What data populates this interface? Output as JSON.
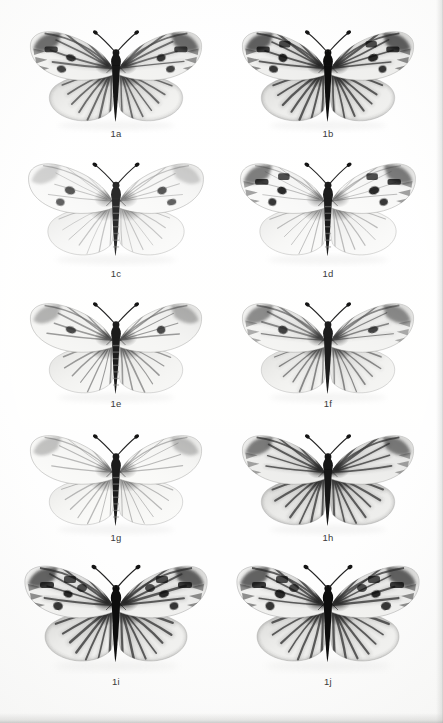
{
  "plate": {
    "title": "Butterfly specimen plate",
    "background_color": "#fbfbfa",
    "label_color": "#3a3a3a",
    "columns": 2,
    "rows": 5,
    "specimen_count": 10
  },
  "specimens": [
    {
      "label": "1a",
      "row": 1,
      "column": 1,
      "x": 22,
      "y": 24,
      "w": 188,
      "h": 104,
      "label_y": 128,
      "pattern": "veins-dark-heavy",
      "spot_count": 3,
      "ground_tone": "#f2f2f0",
      "vein_tone": "#4a4a4a",
      "spot_tone": "#1a1a1a",
      "body_tone": "#151515",
      "wing_shade": 0.62,
      "apex_dark": 0.78,
      "tilt": 0
    },
    {
      "label": "1b",
      "row": 1,
      "column": 2,
      "x": 234,
      "y": 24,
      "w": 188,
      "h": 104,
      "label_y": 128,
      "pattern": "veins-dark-heavy-banded",
      "spot_count": 4,
      "ground_tone": "#efefed",
      "vein_tone": "#3c3c3c",
      "spot_tone": "#111111",
      "body_tone": "#101010",
      "wing_shade": 0.72,
      "apex_dark": 0.86,
      "tilt": 0
    },
    {
      "label": "1c",
      "row": 2,
      "column": 1,
      "x": 20,
      "y": 156,
      "w": 192,
      "h": 110,
      "label_y": 268,
      "pattern": "pale-faint-veins",
      "spot_count": 2,
      "ground_tone": "#fafaf9",
      "vein_tone": "#9a9a9a",
      "spot_tone": "#3f3f3f",
      "body_tone": "#2b2b2b",
      "wing_shade": 0.18,
      "apex_dark": 0.22,
      "tilt": 0
    },
    {
      "label": "1d",
      "row": 2,
      "column": 2,
      "x": 232,
      "y": 156,
      "w": 192,
      "h": 110,
      "label_y": 268,
      "pattern": "pale-bold-spots",
      "spot_count": 4,
      "ground_tone": "#fafaf9",
      "vein_tone": "#8d8d8d",
      "spot_tone": "#0f0f0f",
      "body_tone": "#1b1b1b",
      "wing_shade": 0.22,
      "apex_dark": 0.7,
      "tilt": 0
    },
    {
      "label": "1e",
      "row": 3,
      "column": 1,
      "x": 22,
      "y": 296,
      "w": 188,
      "h": 102,
      "label_y": 398,
      "pattern": "veins-medium",
      "spot_count": 1,
      "ground_tone": "#f6f6f4",
      "vein_tone": "#6a6a6a",
      "spot_tone": "#333333",
      "body_tone": "#1e1e1e",
      "wing_shade": 0.4,
      "apex_dark": 0.38,
      "tilt": 0
    },
    {
      "label": "1f",
      "row": 3,
      "column": 2,
      "x": 234,
      "y": 296,
      "w": 188,
      "h": 102,
      "label_y": 398,
      "pattern": "veins-medium-banded",
      "spot_count": 1,
      "ground_tone": "#f4f4f2",
      "vein_tone": "#5e5e5e",
      "spot_tone": "#2a2a2a",
      "body_tone": "#1a1a1a",
      "wing_shade": 0.5,
      "apex_dark": 0.6,
      "tilt": 0
    },
    {
      "label": "1g",
      "row": 4,
      "column": 1,
      "x": 22,
      "y": 428,
      "w": 188,
      "h": 104,
      "label_y": 532,
      "pattern": "pale-fine-veins",
      "spot_count": 0,
      "ground_tone": "#fafaf8",
      "vein_tone": "#8a8a8a",
      "spot_tone": "#444444",
      "body_tone": "#1d1d1d",
      "wing_shade": 0.26,
      "apex_dark": 0.3,
      "tilt": 0
    },
    {
      "label": "1h",
      "row": 4,
      "column": 2,
      "x": 234,
      "y": 428,
      "w": 188,
      "h": 104,
      "label_y": 532,
      "pattern": "veins-dark-broad",
      "spot_count": 0,
      "ground_tone": "#ededeb",
      "vein_tone": "#3f3f3f",
      "spot_tone": "#202020",
      "body_tone": "#141414",
      "wing_shade": 0.74,
      "apex_dark": 0.68,
      "tilt": 0
    },
    {
      "label": "1i",
      "row": 5,
      "column": 1,
      "x": 16,
      "y": 558,
      "w": 200,
      "h": 116,
      "label_y": 676,
      "pattern": "veins-dark-heavy-spotted",
      "spot_count": 5,
      "ground_tone": "#f0f0ee",
      "vein_tone": "#3a3a3a",
      "spot_tone": "#0d0d0d",
      "body_tone": "#101010",
      "wing_shade": 0.7,
      "apex_dark": 0.84,
      "tilt": 0
    },
    {
      "label": "1j",
      "row": 5,
      "column": 2,
      "x": 228,
      "y": 558,
      "w": 200,
      "h": 116,
      "label_y": 676,
      "pattern": "veins-dark-heavy-spotted",
      "spot_count": 5,
      "ground_tone": "#f0f0ee",
      "vein_tone": "#3a3a3a",
      "spot_tone": "#0d0d0d",
      "body_tone": "#101010",
      "wing_shade": 0.7,
      "apex_dark": 0.84,
      "tilt": 0
    }
  ]
}
